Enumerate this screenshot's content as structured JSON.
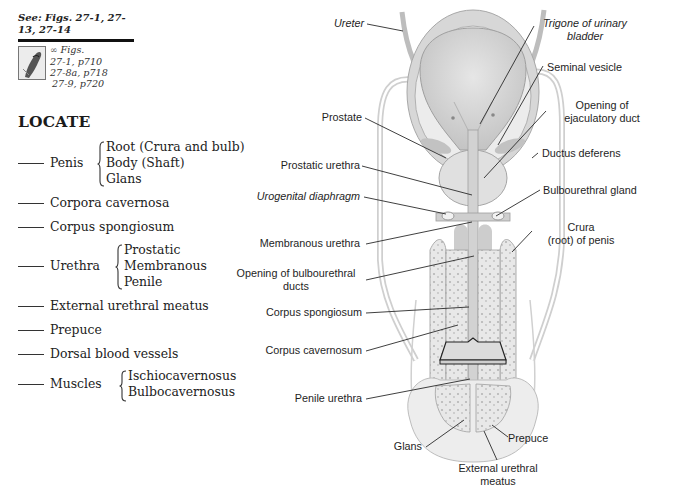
{
  "sidebar": {
    "see_figs": "See: Figs. 27-1, 27-13, 27-14",
    "figs_ref": {
      "icon": "link-icon",
      "label": "Figs.",
      "lines": [
        "27-1, p710",
        "27-8a, p718",
        "27-9, p720"
      ]
    },
    "locate_title": "LOCATE",
    "items": [
      {
        "label": "Penis",
        "subitems": [
          "Root (Crura  and bulb)",
          "Body (Shaft)",
          "Glans"
        ]
      },
      {
        "label": "Corpora cavernosa"
      },
      {
        "label": "Corpus spongiosum"
      },
      {
        "label": "Urethra",
        "subitems": [
          "Prostatic",
          "Membranous",
          "Penile"
        ]
      },
      {
        "label": "External urethral meatus"
      },
      {
        "label": "Prepuce"
      },
      {
        "label": "Dorsal blood vessels"
      },
      {
        "label": "Muscles",
        "subitems": [
          "Ischiocavernosus",
          "Bulbocavernosus"
        ]
      }
    ]
  },
  "diagram": {
    "labels_left": {
      "ureter": "Ureter",
      "prostate": "Prostate",
      "prostatic_urethra": "Prostatic urethra",
      "urogenital_diaphragm": "Urogenital diaphragm",
      "membranous_urethra": "Membranous urethra",
      "opening_bulbourethral_1": "Opening of bulbourethral",
      "opening_bulbourethral_2": "ducts",
      "corpus_spongiosum": "Corpus spongiosum",
      "corpus_cavernosum": "Corpus cavernosum",
      "penile_urethra": "Penile urethra",
      "glans": "Glans"
    },
    "labels_right": {
      "trigone_1": "Trigone of urinary",
      "trigone_2": "bladder",
      "seminal_vesicle": "Seminal vesicle",
      "opening_ejaculatory_1": "Opening of",
      "opening_ejaculatory_2": "ejaculatory duct",
      "ductus_deferens": "Ductus deferens",
      "bulbourethral_gland": "Bulbourethral gland",
      "crura_1": "Crura",
      "crura_2": "(root) of penis",
      "prepuce": "Prepuce"
    },
    "labels_bottom": {
      "external_meatus_1": "External urethral",
      "external_meatus_2": "meatus"
    },
    "colors": {
      "tissue_fill": "#e4e4e4",
      "tissue_dark": "#c9c9c9",
      "outline": "#9a9a9a",
      "leader": "#2a2a2a"
    }
  }
}
